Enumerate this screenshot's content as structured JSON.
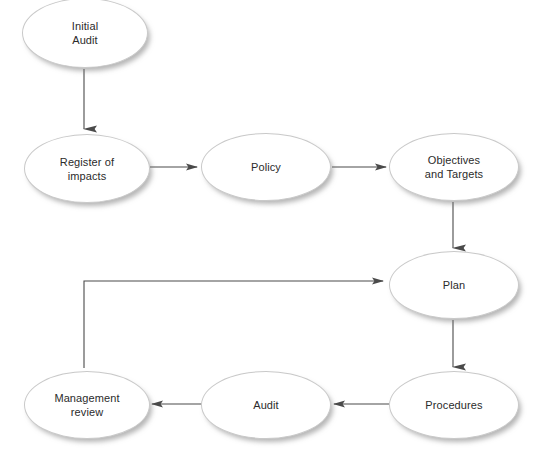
{
  "diagram": {
    "type": "flowchart",
    "canvas": {
      "width": 540,
      "height": 460,
      "background": "#ffffff"
    },
    "style": {
      "node_fill": "#ffffff",
      "node_stroke": "#c9c9c9",
      "edge_color": "#4a4a4a",
      "text_color": "#2b2b2b",
      "shadow_color": "#787878"
    },
    "nodes": [
      {
        "id": "initial-audit",
        "label": "Initial\nAudit",
        "shape": "ellipse",
        "left": 22,
        "top": -2,
        "width": 126,
        "height": 70
      },
      {
        "id": "register-of-impacts",
        "label": "Register of\nimpacts",
        "shape": "ellipse",
        "left": 24,
        "top": 134,
        "width": 126,
        "height": 69
      },
      {
        "id": "policy",
        "label": "Policy",
        "shape": "ellipse",
        "left": 201,
        "top": 133,
        "width": 130,
        "height": 68
      },
      {
        "id": "objectives-and-targets",
        "label": "Objectives\nand Targets",
        "shape": "ellipse",
        "left": 389,
        "top": 133,
        "width": 130,
        "height": 68
      },
      {
        "id": "plan",
        "label": "Plan",
        "shape": "ellipse",
        "left": 389,
        "top": 251,
        "width": 130,
        "height": 68
      },
      {
        "id": "procedures",
        "label": "Procedures",
        "shape": "ellipse",
        "left": 389,
        "top": 371,
        "width": 130,
        "height": 68
      },
      {
        "id": "audit",
        "label": "Audit",
        "shape": "ellipse",
        "left": 201,
        "top": 371,
        "width": 130,
        "height": 68
      },
      {
        "id": "management-review",
        "label": "Management\nreview",
        "shape": "ellipse",
        "left": 24,
        "top": 371,
        "width": 126,
        "height": 68
      }
    ],
    "edges": [
      {
        "id": "edge-initial-audit-to-register",
        "from": "initial-audit",
        "to": "register-of-impacts",
        "direction": "down",
        "points": "84,69 84,130"
      },
      {
        "id": "edge-register-to-policy",
        "from": "register-of-impacts",
        "to": "policy",
        "direction": "right",
        "points": "150,167 196,167"
      },
      {
        "id": "edge-policy-to-objectives",
        "from": "policy",
        "to": "objectives-and-targets",
        "direction": "right",
        "points": "332,167 385,167"
      },
      {
        "id": "edge-objectives-to-plan",
        "from": "objectives-and-targets",
        "to": "plan",
        "direction": "down",
        "points": "453,202 453,248"
      },
      {
        "id": "edge-plan-to-procedures",
        "from": "plan",
        "to": "procedures",
        "direction": "down",
        "points": "453,320 453,368"
      },
      {
        "id": "edge-procedures-to-audit",
        "from": "procedures",
        "to": "audit",
        "direction": "left",
        "points": "388,404 335,404"
      },
      {
        "id": "edge-audit-to-management-review",
        "from": "audit",
        "to": "management-review",
        "direction": "left",
        "points": "204,404 153,404"
      },
      {
        "id": "edge-management-review-to-plan",
        "from": "management-review",
        "to": "plan",
        "direction": "elbow-up-right",
        "points": "84,368 84,281 384,281"
      }
    ]
  }
}
